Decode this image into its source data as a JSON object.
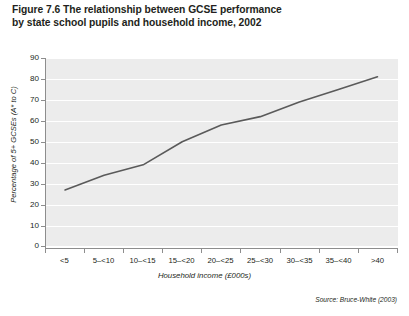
{
  "figure": {
    "title_line1": "Figure 7.6  The relationship between GCSE performance",
    "title_line2": "by state school pupils and household income, 2002",
    "source": "Source: Bruce-White (2003)"
  },
  "chart_data": {
    "type": "line",
    "title": "Figure 7.6  The relationship between GCSE performance by state school pupils and household income, 2002",
    "xlabel": "Household income (£000s)",
    "ylabel": "Percentage of 5+ GCSEs (A* to C)",
    "categories": [
      "<5",
      "5–<10",
      "10–<15",
      "15–<20",
      "20–<25",
      "25–<30",
      "30–<35",
      "35–<40",
      ">40"
    ],
    "values": [
      27,
      34,
      39,
      50,
      58,
      62,
      69,
      75,
      81
    ],
    "ylim": [
      0,
      90
    ],
    "yticks": [
      0,
      10,
      20,
      30,
      40,
      50,
      60,
      70,
      80,
      90
    ],
    "ytick_labels": [
      "0",
      "10",
      "20",
      "30",
      "40",
      "50",
      "60",
      "70",
      "80",
      "90"
    ],
    "grid": true,
    "legend": false,
    "line_color": "#5a5a5a",
    "panel_color": "#ececec",
    "gridline_color": "#ffffff",
    "source": "Source: Bruce-White (2003)"
  },
  "axes": {
    "y_title": "Percentage of 5+ GCSEs (A* to C)",
    "x_title": "Household income (£000s)"
  }
}
